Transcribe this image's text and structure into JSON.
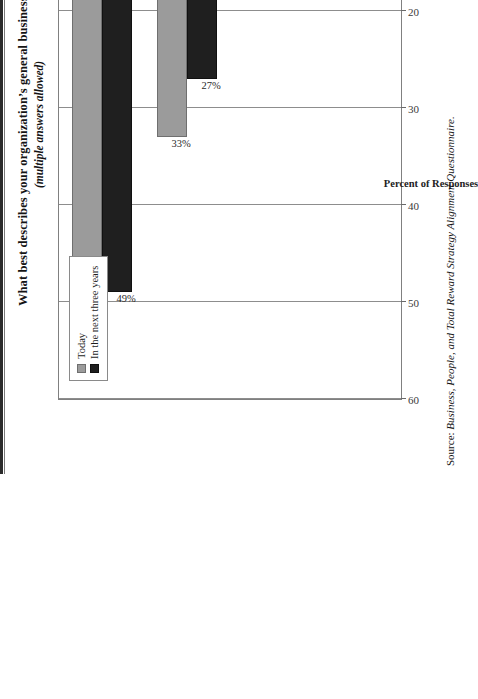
{
  "title": "What best describes your organization’s general business strategy?",
  "subtitle": "(multiple answers allowed)",
  "source": {
    "prefix": "Source: ",
    "text": "Business, People, and Total Reward Strategy Alignment Questionnaire."
  },
  "legend": {
    "items": [
      {
        "label": "Today",
        "color": "#9b9b9b"
      },
      {
        "label": "In the next three years",
        "color": "#1f1f1f"
      }
    ]
  },
  "axis": {
    "value_title": "Percent of Responses",
    "ticks": [
      "60",
      "50",
      "40",
      "30",
      "20",
      "10",
      "0"
    ]
  },
  "chart_data": {
    "type": "bar",
    "orientation": "vertical",
    "title": "What best describes your organization’s general business strategy?",
    "subtitle": "(multiple answers allowed)",
    "xlabel": "",
    "ylabel": "Percent of Responses",
    "ylim": [
      0,
      60
    ],
    "ytick_step": 10,
    "grid": true,
    "legend_position": "top-right",
    "categories": [
      "Differentiation",
      "Focus",
      "Overall Cost Leadership",
      "Other"
    ],
    "series": [
      {
        "name": "Today",
        "color": "#9b9b9b",
        "values": [
          50,
          33,
          16,
          5
        ],
        "labels": [
          "50%",
          "33%",
          "16%",
          "5%"
        ]
      },
      {
        "name": "In the next three years",
        "color": "#1f1f1f",
        "values": [
          49,
          27,
          15,
          5
        ],
        "labels": [
          "49%",
          "27%",
          "15%",
          "5%"
        ]
      }
    ],
    "source": "Source: Business, People, and Total Reward Strategy Alignment Questionnaire."
  }
}
